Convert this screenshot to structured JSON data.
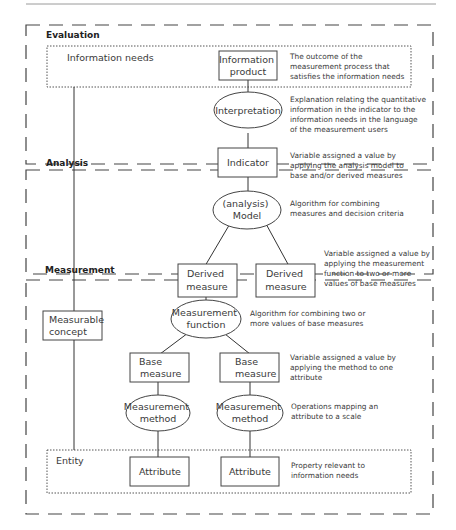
{
  "sections": {
    "evaluation": "Evaluation",
    "analysis": "Analysis",
    "measurement": "Measurement"
  },
  "labels": {
    "information_needs": "Information needs",
    "entity": "Entity"
  },
  "nodes": {
    "information_product": [
      "Information",
      "product"
    ],
    "interpretation": [
      "Interpretation"
    ],
    "indicator": [
      "Indicator"
    ],
    "analysis_model": [
      "(analysis)",
      "Model"
    ],
    "derived_measure_1": [
      "Derived",
      "measure"
    ],
    "derived_measure_2": [
      "Derived",
      "measure"
    ],
    "measurement_function": [
      "Measurement",
      "function"
    ],
    "measurable_concept": [
      "Measurable",
      "concept"
    ],
    "base_measure_1": [
      "Base",
      "measure"
    ],
    "base_measure_2": [
      "Base",
      "measure"
    ],
    "measurement_method_1": [
      "Measurement",
      "method"
    ],
    "measurement_method_2": [
      "Measurement",
      "method"
    ],
    "attribute_1": [
      "Attribute"
    ],
    "attribute_2": [
      "Attribute"
    ]
  },
  "descriptions": {
    "information_product": [
      "The outcome of the",
      "measurement process that",
      "satisfies the information needs"
    ],
    "interpretation": [
      "Explanation relating the quantitative",
      "information in the indicator to the",
      "information needs in the language",
      "of the measurement users"
    ],
    "indicator": [
      "Variable assigned a value by",
      "applying the analysis model to",
      "base and/or derived measures"
    ],
    "analysis_model": [
      "Algorithm for combining",
      "measures and decision criteria"
    ],
    "derived_measure": [
      "Variable assigned a value by",
      "applying the measurement",
      "function to two or more",
      "values of base measures"
    ],
    "measurement_function": [
      "Algorithm for combining two or",
      "more values of base measures"
    ],
    "base_measure": [
      "Variable assigned a value by",
      "applying the method to one",
      "attribute"
    ],
    "measurement_method": [
      "Operations mapping an",
      "attribute to a scale"
    ],
    "attribute": [
      "Property relevant to",
      "information needs"
    ]
  }
}
